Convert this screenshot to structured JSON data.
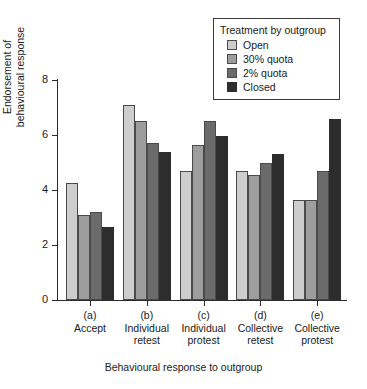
{
  "chart_data": {
    "type": "bar",
    "title": "",
    "xlabel": "Behavioural response to outgroup",
    "ylabel": "Endorsement of behavioural response",
    "ylabel_line1": "Endorsement of",
    "ylabel_line2": "behavioural response",
    "ylim": [
      0,
      8
    ],
    "yticks": [
      0,
      2,
      4,
      6,
      8
    ],
    "ytick_labels": [
      "0",
      "2",
      "4",
      "6",
      "8"
    ],
    "grid": false,
    "legend_position": "top-right",
    "legend_title": "Treatment by outgroup",
    "categories": [
      "(a) Accept",
      "(b) Individual retest",
      "(c) Individual protest",
      "(d) Collective retest",
      "(e) Collective protest"
    ],
    "category_tags": [
      "(a)",
      "(b)",
      "(c)",
      "(d)",
      "(e)"
    ],
    "category_names": [
      "Accept",
      "Individual\nretest",
      "Individual\nprotest",
      "Collective\nretest",
      "Collective\nprotest"
    ],
    "series": [
      {
        "name": "Open",
        "color": "#cdcdcd",
        "values": [
          4.25,
          7.1,
          4.7,
          4.7,
          3.65
        ]
      },
      {
        "name": "30% quota",
        "color": "#9d9d9d",
        "values": [
          3.1,
          6.5,
          5.65,
          4.55,
          3.65
        ]
      },
      {
        "name": "2% quota",
        "color": "#6b6b6b",
        "values": [
          3.2,
          5.7,
          6.5,
          5.0,
          4.7
        ]
      },
      {
        "name": "Closed",
        "color": "#2d2d2d",
        "values": [
          2.65,
          5.4,
          5.95,
          5.3,
          6.6
        ]
      }
    ]
  },
  "xaxis": {
    "groups": [
      {
        "tag": "(a)",
        "line1": "Accept",
        "line2": ""
      },
      {
        "tag": "(b)",
        "line1": "Individual",
        "line2": "retest"
      },
      {
        "tag": "(c)",
        "line1": "Individual",
        "line2": "protest"
      },
      {
        "tag": "(d)",
        "line1": "Collective",
        "line2": "retest"
      },
      {
        "tag": "(e)",
        "line1": "Collective",
        "line2": "protest"
      }
    ],
    "title": "Behavioural response to outgroup"
  },
  "yaxis": {
    "title_line1": "Endorsement of",
    "title_line2": "behavioural response",
    "tick_labels": [
      "0",
      "2",
      "4",
      "6",
      "8"
    ]
  },
  "legend": {
    "title": "Treatment by outgroup",
    "items": [
      {
        "label": "Open",
        "color": "#cdcdcd"
      },
      {
        "label": "30% quota",
        "color": "#9d9d9d"
      },
      {
        "label": "2% quota",
        "color": "#6b6b6b"
      },
      {
        "label": "Closed",
        "color": "#2d2d2d"
      }
    ]
  }
}
